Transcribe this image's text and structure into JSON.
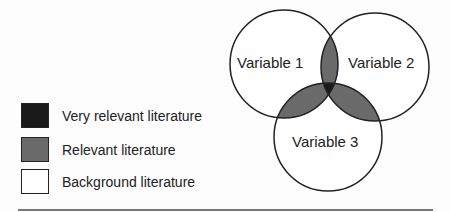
{
  "diagram": {
    "type": "venn",
    "circles": [
      {
        "label": "Variable 1",
        "cx": 284,
        "cy": 64,
        "r": 54
      },
      {
        "label": "Variable 2",
        "cx": 375,
        "cy": 67,
        "r": 54
      },
      {
        "label": "Variable 3",
        "cx": 328,
        "cy": 137,
        "r": 54
      }
    ],
    "colors": {
      "very_relevant": "#1a1a1a",
      "relevant": "#6a6a6a",
      "background": "#ffffff",
      "stroke": "#222222"
    }
  },
  "legend": {
    "items": [
      {
        "label": "Very relevant literature",
        "color": "#1a1a1a"
      },
      {
        "label": "Relevant literature",
        "color": "#6a6a6a"
      },
      {
        "label": "Background literature",
        "color": "#ffffff"
      }
    ]
  }
}
